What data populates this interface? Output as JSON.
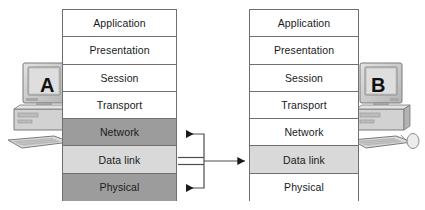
{
  "diagram": {
    "colors": {
      "shade_dark": "#9c9c9c",
      "shade_light": "#d9d9d9",
      "border": "#6f6f6f",
      "background": "#ffffff",
      "arrow": "#1a1a1a"
    }
  },
  "hosts": {
    "left": {
      "label": "A",
      "name": "host-a"
    },
    "right": {
      "label": "B",
      "name": "host-b"
    }
  },
  "stack_left": {
    "name": "osi-stack-a",
    "layers": [
      {
        "label": "Application",
        "shade": "none"
      },
      {
        "label": "Presentation",
        "shade": "none"
      },
      {
        "label": "Session",
        "shade": "none"
      },
      {
        "label": "Transport",
        "shade": "none"
      },
      {
        "label": "Network",
        "shade": "dark"
      },
      {
        "label": "Data link",
        "shade": "light"
      },
      {
        "label": "Physical",
        "shade": "dark"
      }
    ]
  },
  "stack_right": {
    "name": "osi-stack-b",
    "layers": [
      {
        "label": "Application",
        "shade": "none"
      },
      {
        "label": "Presentation",
        "shade": "none"
      },
      {
        "label": "Session",
        "shade": "none"
      },
      {
        "label": "Transport",
        "shade": "none"
      },
      {
        "label": "Network",
        "shade": "none"
      },
      {
        "label": "Data link",
        "shade": "light"
      },
      {
        "label": "Physical",
        "shade": "none"
      }
    ]
  },
  "connectors": [
    {
      "name": "arrow-to-network",
      "direction": "left",
      "from": "data-link-bus",
      "to": "Network"
    },
    {
      "name": "arrow-to-data-link",
      "direction": "right",
      "from": "Data link (A)",
      "to": "Data link (B)"
    },
    {
      "name": "arrow-to-physical",
      "direction": "left",
      "from": "data-link-bus",
      "to": "Physical"
    }
  ]
}
